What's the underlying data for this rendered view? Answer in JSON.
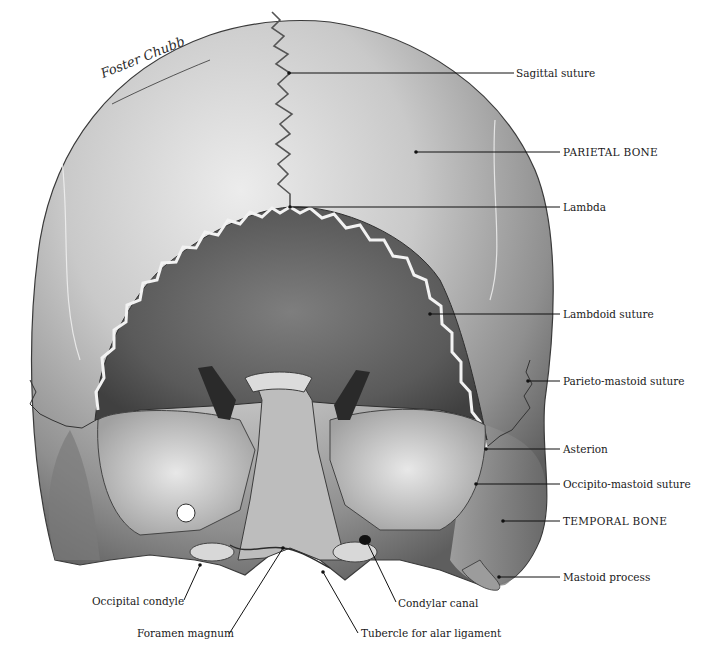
{
  "figure": {
    "artist_signature": "Foster Chubb",
    "colors": {
      "background": "#ffffff",
      "bone_light": "#e6e6e6",
      "bone_mid": "#9a9a9a",
      "bone_dark": "#4a4a4a",
      "label_text": "#1a1a1a",
      "leader_line": "#111111"
    }
  },
  "labels": {
    "right": [
      {
        "id": "sagittal-suture",
        "text": "Sagittal suture",
        "x": 516,
        "y": 68,
        "point": [
          289,
          73
        ],
        "caps": false
      },
      {
        "id": "parietal-bone",
        "text": "PARIETAL BONE",
        "x": 563,
        "y": 148,
        "point": [
          416,
          152
        ],
        "caps": true
      },
      {
        "id": "lambda",
        "text": "Lambda",
        "x": 563,
        "y": 203,
        "point": [
          290,
          207
        ],
        "caps": false
      },
      {
        "id": "lambdoid-suture",
        "text": "Lambdoid suture",
        "x": 563,
        "y": 310,
        "point": [
          430,
          314
        ],
        "caps": false
      },
      {
        "id": "parieto-mastoid-suture",
        "text": "Parieto-mastoid suture",
        "x": 563,
        "y": 377,
        "point": [
          528,
          381
        ],
        "caps": false
      },
      {
        "id": "asterion",
        "text": "Asterion",
        "x": 563,
        "y": 444,
        "point": [
          486,
          449
        ],
        "caps": false
      },
      {
        "id": "occipito-mastoid-suture",
        "text": "Occipito-mastoid suture",
        "x": 563,
        "y": 480,
        "point": [
          476,
          484
        ],
        "caps": false
      },
      {
        "id": "temporal-bone",
        "text": "TEMPORAL BONE",
        "x": 563,
        "y": 517,
        "point": [
          503,
          521
        ],
        "caps": true
      },
      {
        "id": "mastoid-process",
        "text": "Mastoid process",
        "x": 563,
        "y": 573,
        "point": [
          499,
          577
        ],
        "caps": false
      }
    ],
    "bottom": [
      {
        "id": "occipital-condyle",
        "text": "Occipital condyle",
        "x": 92,
        "y": 594,
        "point": [
          200,
          565
        ],
        "anchor": [
          184,
          600
        ]
      },
      {
        "id": "foramen-magnum",
        "text": "Foramen magnum",
        "x": 137,
        "y": 628,
        "point": [
          283,
          548
        ],
        "anchor": [
          229,
          634
        ]
      },
      {
        "id": "condylar-canal",
        "text": "Condylar canal",
        "x": 398,
        "y": 597,
        "point": [
          366,
          540
        ],
        "anchor": [
          396,
          602
        ]
      },
      {
        "id": "tubercle-alar-ligament",
        "text": "Tubercle for alar ligament",
        "x": 361,
        "y": 627,
        "point": [
          323,
          572
        ],
        "anchor": [
          358,
          633
        ]
      }
    ]
  }
}
